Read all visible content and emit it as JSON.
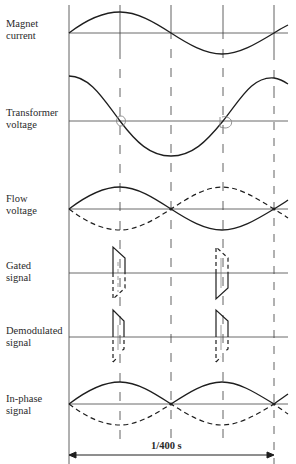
{
  "diagram": {
    "type": "timing-diagram",
    "title": "",
    "ink_color": "#2a2a2a",
    "guide_color": "#555555",
    "traces": [
      {
        "id": "magnet-current",
        "label_line1": "Magnet",
        "label_line2": "current",
        "baseline_y": 33,
        "waveform": "sine",
        "amplitude": 21,
        "style": "solid"
      },
      {
        "id": "transformer-voltage",
        "label_line1": "Transformer",
        "label_line2": "voltage",
        "baseline_y": 121,
        "waveform": "cosine",
        "amplitude": 45,
        "style": "solid",
        "annotations": [
          "gate-circle-at-quarter",
          "gate-circle-at-three-quarter"
        ]
      },
      {
        "id": "flow-voltage",
        "label_line1": "Flow",
        "label_line2": "voltage",
        "baseline_y": 209,
        "waveform": "sine plus inverted dashed",
        "amplitude": 22,
        "style": "solid+dashed"
      },
      {
        "id": "gated-signal",
        "label_line1": "Gated",
        "label_line2": "signal",
        "baseline_y": 273,
        "waveform": "trapezoid pulses",
        "style": "solid+dashed"
      },
      {
        "id": "demodulated-signal",
        "label_line1": "Demodulated",
        "label_line2": "signal",
        "baseline_y": 337,
        "waveform": "rectified pulses",
        "style": "solid+dashed"
      },
      {
        "id": "in-phase-signal",
        "label_line1": "In-phase",
        "label_line2": "signal",
        "baseline_y": 404,
        "waveform": "full-wave rectified sine",
        "amplitude": 22,
        "style": "solid+dashed"
      }
    ],
    "time_markers_x": [
      69,
      120,
      171,
      223,
      274
    ],
    "period_label": "1/400 s"
  }
}
